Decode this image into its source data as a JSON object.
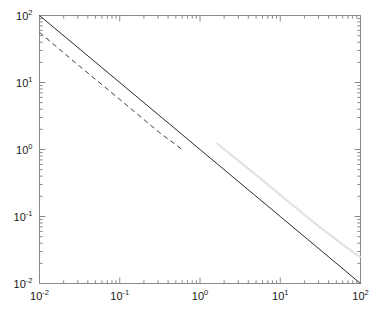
{
  "chart_data": {
    "type": "line",
    "title": "",
    "xlabel": "",
    "ylabel": "",
    "xscale": "log",
    "yscale": "log",
    "xlim": [
      0.01,
      100
    ],
    "ylim": [
      0.01,
      100
    ],
    "grid": false,
    "legend": "none",
    "xticks": [
      0.01,
      0.1,
      1,
      10,
      100
    ],
    "yticks": [
      0.01,
      0.1,
      1,
      10,
      100
    ],
    "xtick_labels": [
      "10-2",
      "10-1",
      "100",
      "101",
      "102"
    ],
    "ytick_labels": [
      "10-2",
      "10-1",
      "100",
      "101",
      "102"
    ],
    "minor_ticks": true,
    "series": [
      {
        "name": "solid-reference-line",
        "style": "solid",
        "color": "#2b2b2b",
        "width": 1.0,
        "x": [
          0.01,
          0.1,
          1,
          10,
          100
        ],
        "y": [
          100,
          10,
          1,
          0.1,
          0.01
        ],
        "slope": -1
      },
      {
        "name": "dashed-line",
        "style": "dashed",
        "color": "#3a3a3a",
        "width": 1.0,
        "x": [
          0.01,
          0.0316,
          0.1,
          0.316,
          0.6
        ],
        "y": [
          56,
          17.5,
          5.6,
          1.77,
          1.0
        ],
        "slope": -1
      },
      {
        "name": "light-gray-curve",
        "style": "solid",
        "color": "#e2e2e2",
        "width": 2.2,
        "x": [
          1.6,
          3.0,
          6.0,
          12.0,
          30.0,
          60.0,
          100.0
        ],
        "y": [
          1.25,
          0.68,
          0.35,
          0.175,
          0.072,
          0.038,
          0.0245
        ],
        "slope": -1
      }
    ]
  },
  "axes": {
    "x_tick_labels": [
      {
        "mantissa": "10",
        "exponent": "-2",
        "value": 0.01
      },
      {
        "mantissa": "10",
        "exponent": "-1",
        "value": 0.1
      },
      {
        "mantissa": "10",
        "exponent": "0",
        "value": 1
      },
      {
        "mantissa": "10",
        "exponent": "1",
        "value": 10
      },
      {
        "mantissa": "10",
        "exponent": "2",
        "value": 100
      }
    ],
    "y_tick_labels": [
      {
        "mantissa": "10",
        "exponent": "2",
        "value": 100
      },
      {
        "mantissa": "10",
        "exponent": "1",
        "value": 10
      },
      {
        "mantissa": "10",
        "exponent": "0",
        "value": 1
      },
      {
        "mantissa": "10",
        "exponent": "-1",
        "value": 0.1
      },
      {
        "mantissa": "10",
        "exponent": "-2",
        "value": 0.01
      }
    ]
  },
  "style": {
    "frame_color": "#8a8a8a",
    "tick_color": "#8a8a8a",
    "background": "#ffffff",
    "text_color": "#1a1a1a"
  }
}
